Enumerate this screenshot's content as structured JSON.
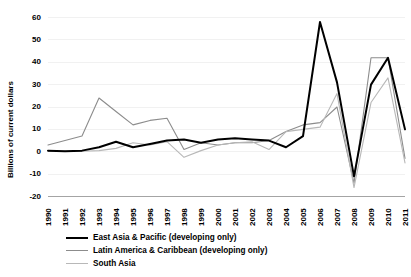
{
  "chart_data": {
    "type": "line",
    "title": "",
    "xlabel": "",
    "ylabel": "Billions of current dollars",
    "ylim": [
      -20,
      60
    ],
    "yticks": [
      60,
      50,
      40,
      30,
      20,
      10,
      0,
      -10,
      -20
    ],
    "ytick_labels": [
      "60",
      "50",
      "40",
      "30",
      "20",
      "10",
      "0",
      "-10",
      "-20"
    ],
    "grid": true,
    "legend_position": "bottom",
    "categories": [
      "1990",
      "1991",
      "1992",
      "1993",
      "1994",
      "1995",
      "1996",
      "1997",
      "1998",
      "1999",
      "2000",
      "2001",
      "2002",
      "2003",
      "2004",
      "2005",
      "2006",
      "2007",
      "2008",
      "2009",
      "2010",
      "2011"
    ],
    "series": [
      {
        "name": "East Asia & Pacific (developing only)",
        "color": "#000000",
        "width": 2.0,
        "values": [
          0.5,
          0.2,
          0.5,
          2.0,
          4.5,
          2.0,
          3.5,
          5.0,
          5.5,
          4.0,
          5.5,
          6.0,
          5.5,
          5.0,
          2.0,
          7.0,
          58.0,
          31.0,
          -11.0,
          30.0,
          42.0,
          10.0
        ]
      },
      {
        "name": "Latin America & Caribbean (developing only)",
        "color": "#8c8c8c",
        "width": 1.1,
        "values": [
          3.0,
          5.0,
          7.0,
          24.0,
          18.0,
          12.0,
          14.0,
          15.0,
          1.0,
          4.0,
          3.0,
          4.0,
          4.0,
          5.0,
          9.0,
          12.0,
          13.0,
          20.0,
          -14.0,
          42.0,
          42.0,
          -3.0
        ]
      },
      {
        "name": "South Asia",
        "color": "#b8b8b8",
        "width": 1.1,
        "values": [
          0.3,
          0.2,
          0.2,
          0.5,
          1.5,
          4.0,
          3.0,
          4.5,
          -2.5,
          0.5,
          3.0,
          4.0,
          4.5,
          1.0,
          9.0,
          10.0,
          11.0,
          26.0,
          -16.0,
          22.0,
          33.0,
          -5.0
        ]
      }
    ]
  },
  "legend": {
    "items": [
      {
        "label": "East Asia & Pacific (developing only)"
      },
      {
        "label": "Latin America & Caribbean (developing only)"
      },
      {
        "label": "South Asia"
      }
    ]
  }
}
